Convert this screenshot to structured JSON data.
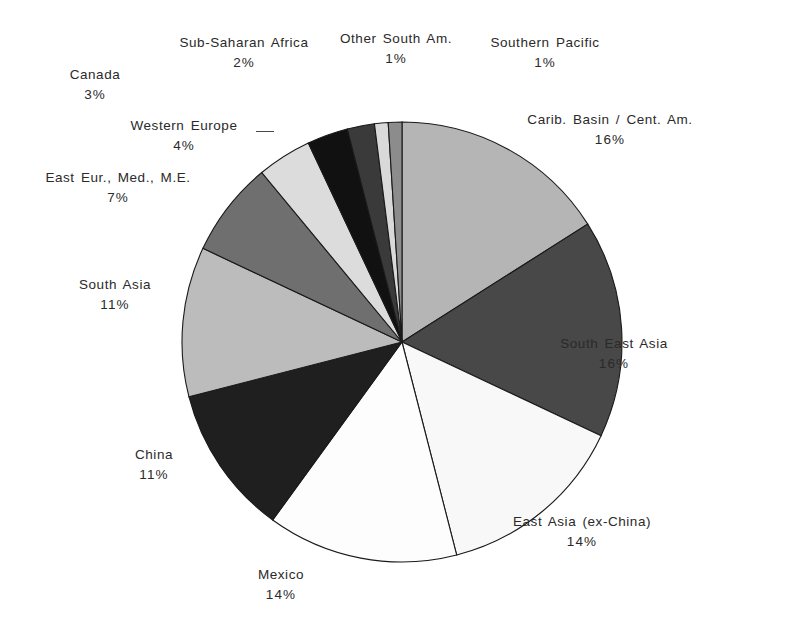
{
  "chart_data": {
    "type": "pie",
    "title": "",
    "subtitle": "",
    "xlabel": "",
    "ylabel": "",
    "legend_position": "none",
    "grid": false,
    "start_angle_deg": 0,
    "direction": "clockwise",
    "units": "percent",
    "categories": [
      "Carib. Basin / Cent. Am.",
      "South East Asia",
      "East Asia (ex-China)",
      "Mexico",
      "China",
      "South Asia",
      "East Eur., Med., M.E.",
      "Western Europe",
      "Canada",
      "Sub-Saharan Africa",
      "Other South Am.",
      "Southern Pacific"
    ],
    "values": [
      16,
      16,
      14,
      14,
      11,
      11,
      7,
      4,
      3,
      2,
      1,
      1
    ],
    "value_labels": [
      "16%",
      "16%",
      "14%",
      "14%",
      "11%",
      "11%",
      "7%",
      "4%",
      "3%",
      "2%",
      "1%",
      "1%"
    ],
    "colors": [
      "#b5b5b5",
      "#484848",
      "#f8f8f8",
      "#fdfdfd",
      "#1f1f1f",
      "#bcbcbc",
      "#6f6f6f",
      "#dcdcdc",
      "#111111",
      "#3a3a3a",
      "#d9d9d9",
      "#8c8c8c"
    ],
    "slice_outline_color": "#1a1a1a",
    "geometry": {
      "cx": 402,
      "cy": 342,
      "r": 220
    }
  },
  "labels": [
    {
      "name": "carib-basin",
      "text": "Carib. Basin / Cent. Am.",
      "pct": "16%"
    },
    {
      "name": "south-east-asia",
      "text": "South East Asia",
      "pct": "16%"
    },
    {
      "name": "east-asia-ex-china",
      "text": "East Asia (ex-China)",
      "pct": "14%"
    },
    {
      "name": "mexico",
      "text": "Mexico",
      "pct": "14%"
    },
    {
      "name": "china",
      "text": "China",
      "pct": "11%"
    },
    {
      "name": "south-asia",
      "text": "South Asia",
      "pct": "11%"
    },
    {
      "name": "east-eur-med-me",
      "text": "East Eur., Med., M.E.",
      "pct": "7%"
    },
    {
      "name": "western-europe",
      "text": "Western Europe",
      "pct": "4%"
    },
    {
      "name": "canada",
      "text": "Canada",
      "pct": "3%"
    },
    {
      "name": "sub-saharan-africa",
      "text": "Sub-Saharan Africa",
      "pct": "2%"
    },
    {
      "name": "other-south-am",
      "text": "Other South Am.",
      "pct": "1%"
    },
    {
      "name": "southern-pacific",
      "text": "Southern Pacific",
      "pct": "1%"
    }
  ]
}
